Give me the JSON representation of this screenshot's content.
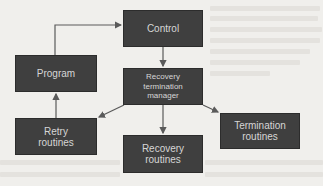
{
  "diagram": {
    "type": "flowchart",
    "colors": {
      "background": "#f0efec",
      "box_fill": "#3f3f3f",
      "box_text": "#d6d6d6",
      "arrow": "#5a5a5a"
    },
    "nodes": {
      "control": {
        "label": "Control"
      },
      "program": {
        "label": "Program"
      },
      "manager": {
        "label": "Recovery termination manager"
      },
      "retry": {
        "label": "Retry routines"
      },
      "recovery": {
        "label": "Recovery routines"
      },
      "termination": {
        "label": "Termination routines"
      }
    },
    "edges": [
      {
        "from": "program",
        "to": "control"
      },
      {
        "from": "control",
        "to": "manager"
      },
      {
        "from": "manager",
        "to": "retry"
      },
      {
        "from": "manager",
        "to": "recovery"
      },
      {
        "from": "manager",
        "to": "termination"
      },
      {
        "from": "retry",
        "to": "program"
      }
    ]
  }
}
